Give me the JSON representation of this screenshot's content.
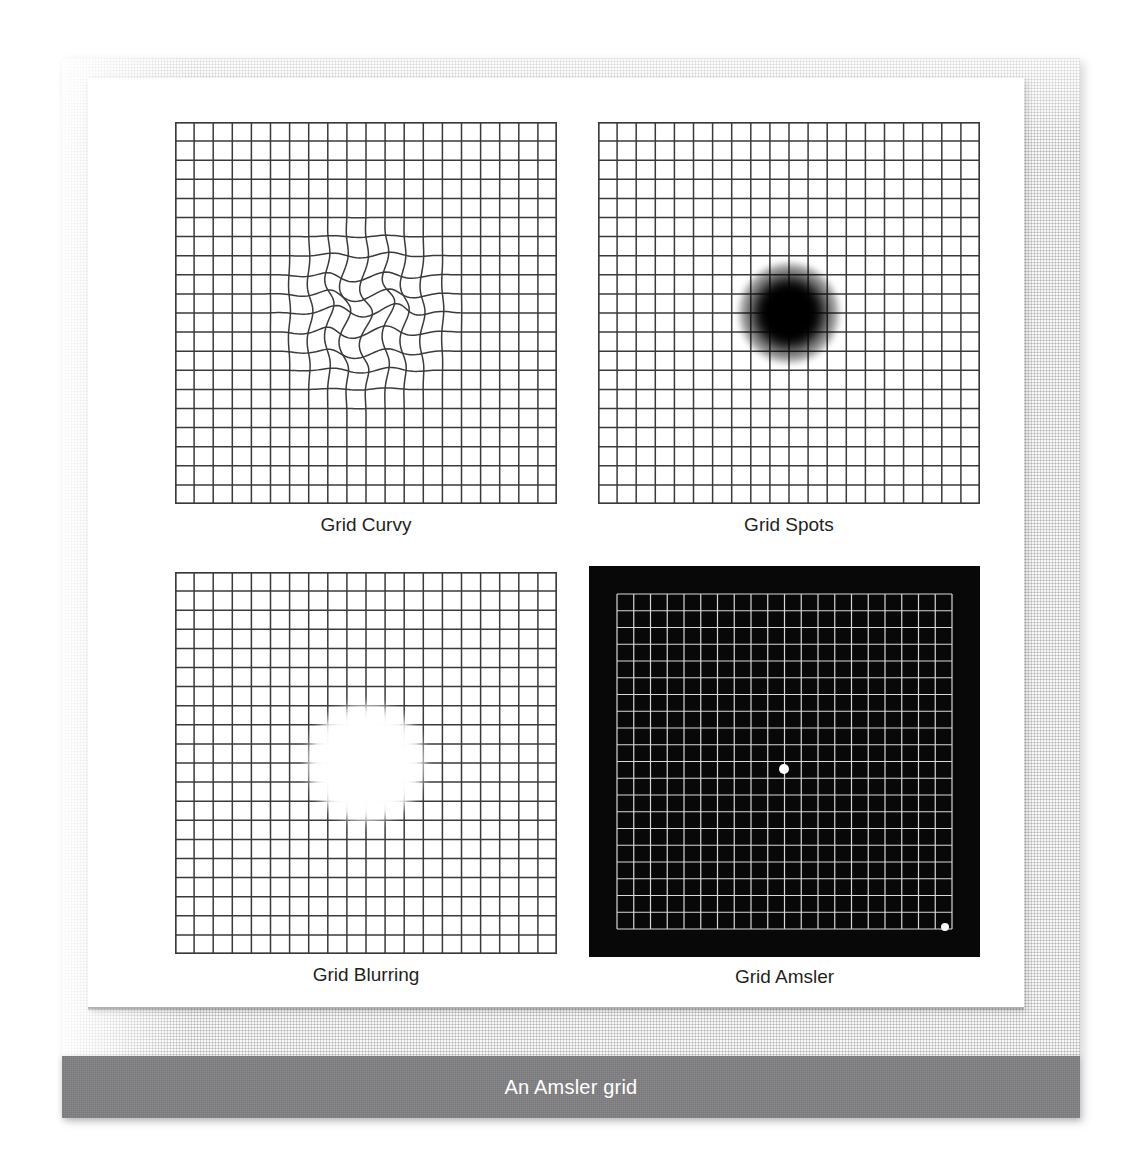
{
  "figure": {
    "caption": "An Amsler grid",
    "caption_bar_color": "#808082",
    "caption_text_color": "#ffffff",
    "page_color": "#ffffff",
    "texture_color": "#f7f7f6"
  },
  "panels": [
    {
      "id": "curvy",
      "label": "Grid Curvy",
      "style": "light",
      "grid_line_color": "#3a3a3c",
      "background_color": "#ffffff",
      "columns": 20,
      "rows": 20,
      "effect": "wavy-distortion",
      "effect_description": "Central region of the grid is wavy / metamorphopsia distortion",
      "effect_center": [
        191,
        191
      ],
      "effect_radius": 105
    },
    {
      "id": "spots",
      "label": "Grid Spots",
      "style": "light",
      "grid_line_color": "#3a3a3c",
      "background_color": "#ffffff",
      "columns": 20,
      "rows": 20,
      "effect": "dark-scotoma",
      "effect_description": "Soft-edged black blob obscuring the centre of the grid",
      "effect_color": "#000000",
      "effect_center": [
        191,
        191
      ],
      "effect_radius": 50
    },
    {
      "id": "blurring",
      "label": "Grid Blurring",
      "style": "light",
      "grid_line_color": "#3a3a3c",
      "background_color": "#ffffff",
      "columns": 20,
      "rows": 20,
      "effect": "white-scotoma",
      "effect_description": "Soft-edged white blob washing out the centre of the grid",
      "effect_color": "#ffffff",
      "effect_center": [
        191,
        191
      ],
      "effect_radius": 59
    },
    {
      "id": "amsler",
      "label": "Grid Amsler",
      "style": "dark",
      "grid_line_color": "#d8d8d8",
      "background_color": "#080808",
      "columns": 20,
      "rows": 20,
      "effect": "fixation-dots",
      "effect_description": "Standard Amsler chart: white grid on black with a central fixation dot and a second dot lower-right",
      "dots": [
        {
          "name": "central-fixation-dot",
          "x": 195,
          "y": 203,
          "r": 5
        },
        {
          "name": "secondary-dot",
          "x": 356,
          "y": 361,
          "r": 4
        }
      ]
    }
  ]
}
